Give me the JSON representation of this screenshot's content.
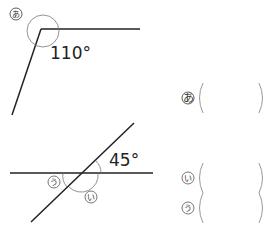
{
  "figure1": {
    "marker": "あ",
    "angle_label": "110°"
  },
  "figure2": {
    "angle_label": "45°",
    "marker_i": "い",
    "marker_u": "う"
  },
  "answers": [
    {
      "marker": "あ",
      "value": ""
    },
    {
      "marker": "い",
      "value": ""
    },
    {
      "marker": "う",
      "value": ""
    }
  ]
}
